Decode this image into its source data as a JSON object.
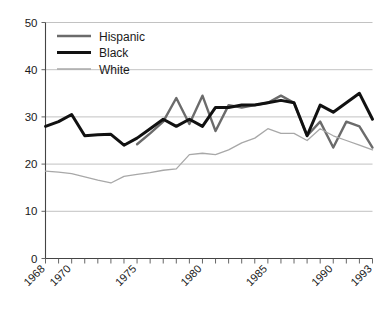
{
  "chart_data": {
    "type": "line",
    "title": "",
    "subtitle": "",
    "xlabel": "",
    "ylabel": "",
    "xlim": [
      1968,
      1993
    ],
    "ylim": [
      0,
      50
    ],
    "grid": true,
    "legend_position": "top-left",
    "y_ticks": [
      0,
      10,
      20,
      30,
      40,
      50
    ],
    "y_tick_labels": [
      "0",
      "10",
      "20",
      "30",
      "40",
      "50"
    ],
    "x_ticks": [
      1968,
      1969,
      1970,
      1971,
      1972,
      1973,
      1974,
      1975,
      1976,
      1977,
      1978,
      1979,
      1980,
      1981,
      1982,
      1983,
      1984,
      1985,
      1986,
      1987,
      1988,
      1989,
      1990,
      1991,
      1992,
      1993
    ],
    "x_tick_labels_shown": [
      "1968",
      "1970",
      "1975",
      "1980",
      "1985",
      "1990",
      "1993"
    ],
    "x_tick_label_values": [
      1968,
      1970,
      1975,
      1980,
      1985,
      1990,
      1993
    ],
    "x": [
      1968,
      1969,
      1970,
      1971,
      1972,
      1973,
      1974,
      1975,
      1976,
      1977,
      1978,
      1979,
      1980,
      1981,
      1982,
      1983,
      1984,
      1985,
      1986,
      1987,
      1988,
      1989,
      1990,
      1991,
      1992,
      1993
    ],
    "series": [
      {
        "name": "Hispanic",
        "color": "#6b6b6b",
        "width": 2.4,
        "x": [
          1975,
          1976,
          1977,
          1978,
          1979,
          1980,
          1981,
          1982,
          1983,
          1984,
          1985,
          1986,
          1987,
          1988,
          1989,
          1990,
          1991,
          1992,
          1993
        ],
        "values": [
          24.2,
          26.5,
          29.0,
          34.0,
          28.5,
          34.5,
          27.0,
          32.5,
          32.0,
          32.5,
          33.0,
          34.5,
          33.0,
          26.0,
          29.0,
          23.5,
          29.0,
          28.0,
          23.5
        ]
      },
      {
        "name": "Black",
        "color": "#111111",
        "width": 3.0,
        "x": [
          1968,
          1969,
          1970,
          1971,
          1972,
          1973,
          1974,
          1975,
          1976,
          1977,
          1978,
          1979,
          1980,
          1981,
          1982,
          1983,
          1984,
          1985,
          1986,
          1987,
          1988,
          1989,
          1990,
          1991,
          1992,
          1993
        ],
        "values": [
          28.0,
          29.0,
          30.5,
          26.0,
          26.2,
          26.3,
          24.0,
          25.5,
          27.5,
          29.5,
          28.0,
          29.5,
          28.0,
          32.0,
          32.0,
          32.5,
          32.5,
          33.0,
          33.5,
          33.0,
          26.0,
          32.5,
          31.0,
          33.0,
          35.0,
          29.5
        ]
      },
      {
        "name": "White",
        "color": "#a8a8a8",
        "width": 1.3,
        "x": [
          1968,
          1969,
          1970,
          1971,
          1972,
          1973,
          1974,
          1975,
          1976,
          1977,
          1978,
          1979,
          1980,
          1981,
          1982,
          1983,
          1984,
          1985,
          1986,
          1987,
          1988,
          1989,
          1990,
          1991,
          1992,
          1993
        ],
        "values": [
          18.5,
          18.3,
          18.0,
          17.3,
          16.6,
          16.0,
          17.4,
          17.8,
          18.2,
          18.7,
          19.0,
          22.0,
          22.3,
          22.0,
          23.0,
          24.5,
          25.5,
          27.5,
          26.5,
          26.5,
          25.0,
          27.5,
          26.0,
          25.0,
          24.0,
          23.0
        ]
      }
    ],
    "legend": [
      {
        "label": "Hispanic",
        "color": "#6b6b6b",
        "width": 2.4
      },
      {
        "label": "Black",
        "color": "#111111",
        "width": 3.0
      },
      {
        "label": "White",
        "color": "#a8a8a8",
        "width": 1.3
      }
    ],
    "colors": {
      "hispanic": "#6b6b6b",
      "black": "#111111",
      "white": "#a8a8a8",
      "gridline": "#b3b3b3",
      "axis": "#444444",
      "background": "#ffffff"
    }
  }
}
